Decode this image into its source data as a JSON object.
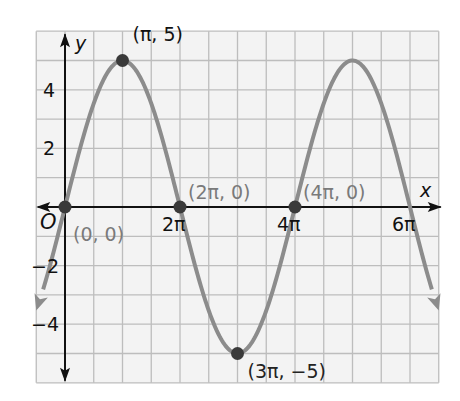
{
  "chart_data": {
    "type": "line",
    "function": "y = 5 sin(x / 2)",
    "amplitude": 5,
    "period_pi": 4,
    "xlabel": "x",
    "ylabel": "y",
    "origin_label": "O",
    "xlim_pi": [
      -0.5,
      6.5
    ],
    "ylim": [
      -6,
      6
    ],
    "x_grid_step_pi": 0.5,
    "y_grid_step": 1,
    "grid": true,
    "x_ticks": [
      {
        "value_pi": 2,
        "label": "2π"
      },
      {
        "value_pi": 4,
        "label": "4π"
      },
      {
        "value_pi": 6,
        "label": "6π"
      }
    ],
    "y_ticks": [
      {
        "value": 4,
        "label": "4"
      },
      {
        "value": 2,
        "label": "2"
      },
      {
        "value": -2,
        "label": "−2"
      },
      {
        "value": -4,
        "label": "−4"
      }
    ],
    "points": [
      {
        "x_pi": 0,
        "y": 0,
        "label": "(0, 0)"
      },
      {
        "x_pi": 1,
        "y": 5,
        "label": "(π, 5)"
      },
      {
        "x_pi": 2,
        "y": 0,
        "label": "(2π, 0)"
      },
      {
        "x_pi": 3,
        "y": -5,
        "label": "(3π, −5)"
      },
      {
        "x_pi": 4,
        "y": 0,
        "label": "(4π, 0)"
      }
    ],
    "curve_domain_pi": [
      -0.5,
      6.5
    ],
    "colors": {
      "curve": "#8c8c8c",
      "point": "#3a3a3a",
      "grid": "#bdbdbd",
      "background": "#f3f3f3",
      "axis": "#111111",
      "point_label": "#7a7a7a"
    }
  }
}
